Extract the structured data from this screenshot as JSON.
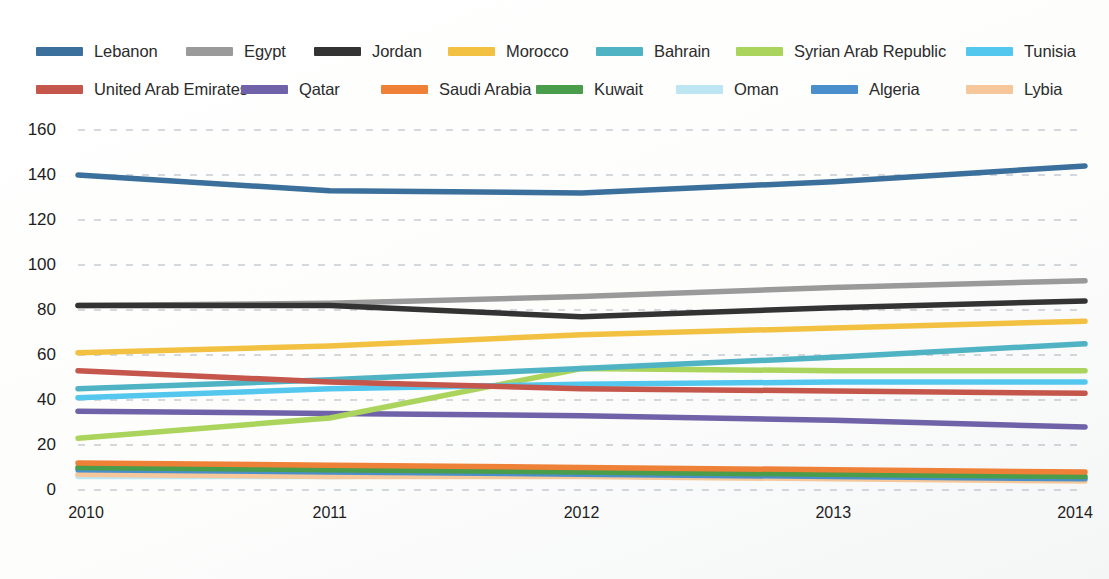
{
  "chart_data": {
    "type": "line",
    "title": "",
    "xlabel": "",
    "ylabel": "",
    "x": [
      2010,
      2011,
      2012,
      2013,
      2014
    ],
    "categories": [
      "2010",
      "2011",
      "2012",
      "2013",
      "2014"
    ],
    "xtick_labels": [
      "2010",
      "2011",
      "2012",
      "2013",
      "2014"
    ],
    "ytick_labels": [
      "0",
      "20",
      "40",
      "60",
      "80",
      "100",
      "120",
      "140",
      "160"
    ],
    "yticks": [
      0,
      20,
      40,
      60,
      80,
      100,
      120,
      140,
      160
    ],
    "ylim": [
      0,
      160
    ],
    "xlim": [
      2010,
      2014
    ],
    "grid": "horizontal-dashed",
    "legend_position": "top",
    "legend_columns": 7,
    "series": [
      {
        "name": "Lebanon",
        "color": "#3b6f9c",
        "values": [
          140,
          133,
          132,
          137,
          144
        ]
      },
      {
        "name": "Egypt",
        "color": "#9a9a9a",
        "values": [
          82,
          83,
          86,
          90,
          93
        ]
      },
      {
        "name": "Jordan",
        "color": "#333333",
        "values": [
          82,
          82,
          77,
          81,
          84
        ]
      },
      {
        "name": "Morocco",
        "color": "#f2c141",
        "values": [
          61,
          64,
          69,
          72,
          75
        ]
      },
      {
        "name": "Bahrain",
        "color": "#4fb3c4",
        "values": [
          45,
          49,
          54,
          59,
          65
        ]
      },
      {
        "name": "Syrian Arab Republic",
        "color": "#abd45c",
        "values": [
          23,
          32,
          54,
          53,
          53
        ]
      },
      {
        "name": "Tunisia",
        "color": "#53c7ed",
        "values": [
          41,
          45,
          47,
          48,
          48
        ]
      },
      {
        "name": "United Arab Emirates",
        "color": "#c4564c",
        "values": [
          53,
          48,
          45,
          44,
          43
        ]
      },
      {
        "name": "Qatar",
        "color": "#6f62a8",
        "values": [
          35,
          34,
          33,
          31,
          28
        ]
      },
      {
        "name": "Saudi Arabia",
        "color": "#ee8037",
        "values": [
          12,
          11,
          10,
          9,
          8
        ]
      },
      {
        "name": "Kuwait",
        "color": "#4a9d4a",
        "values": [
          10,
          9,
          8,
          7,
          6
        ]
      },
      {
        "name": "Oman",
        "color": "#bde5f2",
        "values": [
          6,
          6,
          7,
          6,
          5
        ]
      },
      {
        "name": "Algeria",
        "color": "#4a8fcb",
        "values": [
          9,
          8,
          7,
          6,
          5
        ]
      },
      {
        "name": "Lybia",
        "color": "#f5c79a",
        "values": [
          7,
          6,
          6,
          5,
          4
        ]
      }
    ]
  },
  "legend": {
    "row1": [
      {
        "label": "Lebanon",
        "color": "#3b6f9c"
      },
      {
        "label": "Egypt",
        "color": "#9a9a9a"
      },
      {
        "label": "Jordan",
        "color": "#333333"
      },
      {
        "label": "Morocco",
        "color": "#f2c141"
      },
      {
        "label": "Bahrain",
        "color": "#4fb3c4"
      },
      {
        "label": "Syrian Arab Republic",
        "color": "#abd45c"
      },
      {
        "label": "Tunisia",
        "color": "#53c7ed"
      }
    ],
    "row2": [
      {
        "label": "United Arab Emirates",
        "color": "#c4564c"
      },
      {
        "label": "Qatar",
        "color": "#6f62a8"
      },
      {
        "label": "Saudi Arabia",
        "color": "#ee8037"
      },
      {
        "label": "Kuwait",
        "color": "#4a9d4a"
      },
      {
        "label": "Oman",
        "color": "#bde5f2"
      },
      {
        "label": "Algeria",
        "color": "#4a8fcb"
      },
      {
        "label": "Lybia",
        "color": "#f5c79a"
      }
    ]
  }
}
